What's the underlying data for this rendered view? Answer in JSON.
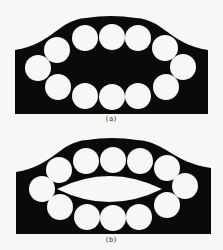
{
  "figure": {
    "background": "#f7f7f5",
    "ink": "#0a0a0a",
    "hole_fill": "#f7f7f5",
    "panels": [
      {
        "id": "a",
        "label": "(a)",
        "label_pos": [
          111,
          121
        ],
        "outline": {
          "left": 15,
          "right": 208,
          "bottom": 114,
          "left_shoulder_y": 50,
          "right_shoulder_y": 50,
          "peak_x": 111,
          "peak_y": 16
        },
        "circle_radius": 13,
        "circles": [
          [
            38,
            68
          ],
          [
            57,
            50
          ],
          [
            85,
            38
          ],
          [
            112,
            37
          ],
          [
            138,
            38
          ],
          [
            165,
            48
          ],
          [
            183,
            67
          ],
          [
            166,
            87
          ],
          [
            138,
            96
          ],
          [
            112,
            97
          ],
          [
            85,
            96
          ],
          [
            58,
            87
          ]
        ],
        "center_lens": null
      },
      {
        "id": "b",
        "label": "(b)",
        "label_pos": [
          111,
          242
        ],
        "outline": {
          "left": 16,
          "right": 211,
          "bottom": 234,
          "left_shoulder_y": 172,
          "right_shoulder_y": 168,
          "peak_x": 112,
          "peak_y": 138
        },
        "circle_radius": 13,
        "circles": [
          [
            42,
            189
          ],
          [
            59,
            170
          ],
          [
            86,
            161
          ],
          [
            113,
            160
          ],
          [
            140,
            161
          ],
          [
            167,
            168
          ],
          [
            185,
            186
          ],
          [
            167,
            205
          ],
          [
            139,
            217
          ],
          [
            113,
            218
          ],
          [
            87,
            217
          ],
          [
            60,
            207
          ]
        ],
        "center_lens": {
          "x1": 57,
          "x2": 162,
          "cy": 189,
          "half_height": 13
        }
      }
    ]
  }
}
